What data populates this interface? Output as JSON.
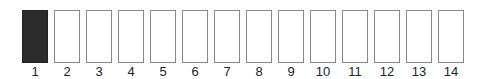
{
  "slots": [
    {
      "label": "1",
      "filled": true
    },
    {
      "label": "2",
      "filled": false
    },
    {
      "label": "3",
      "filled": false
    },
    {
      "label": "4",
      "filled": false
    },
    {
      "label": "5",
      "filled": false
    },
    {
      "label": "6",
      "filled": false
    },
    {
      "label": "7",
      "filled": false
    },
    {
      "label": "8",
      "filled": false
    },
    {
      "label": "9",
      "filled": false
    },
    {
      "label": "10",
      "filled": false
    },
    {
      "label": "11",
      "filled": false
    },
    {
      "label": "12",
      "filled": false
    },
    {
      "label": "13",
      "filled": false
    },
    {
      "label": "14",
      "filled": false
    }
  ],
  "colors": {
    "filled": "#2b2b2b",
    "empty": "#ffffff",
    "border": "#8a8a8a"
  }
}
